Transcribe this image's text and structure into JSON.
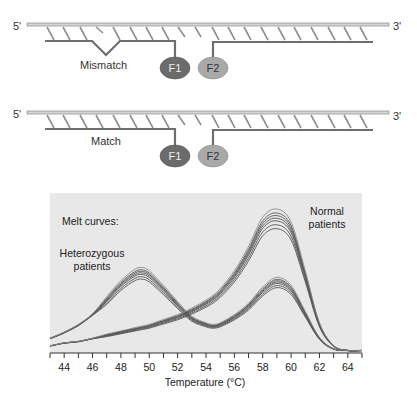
{
  "panels": {
    "mismatch": {
      "five_prime": "5'",
      "three_prime": "3'",
      "label": "Mismatch",
      "probe1": "F1",
      "probe2": "F2"
    },
    "match": {
      "five_prime": "5'",
      "three_prime": "3'",
      "label": "Match",
      "probe1": "F1",
      "probe2": "F2"
    }
  },
  "colors": {
    "strand": "#c8c8c8",
    "strand_outline": "#9a9a9a",
    "hatch": "#8f8f8f",
    "probe_line": "#6e6e6e",
    "f1_fill": "#6b6b6b",
    "f2_fill": "#a9a9a9",
    "chart_bg": "#e8e8e8",
    "curve": "#555555"
  },
  "chart_data": {
    "type": "line",
    "title": "",
    "annotations": [
      "Melt curves:",
      "Heterozygous patients",
      "Normal patients"
    ],
    "xlabel": "Temperature (°C)",
    "ylabel": "",
    "xlim": [
      43,
      65
    ],
    "x_ticks": [
      44,
      46,
      48,
      50,
      52,
      54,
      56,
      58,
      60,
      62,
      64
    ],
    "grid": false,
    "legend": "none (inline annotations)",
    "x": [
      43,
      44,
      45,
      46,
      47,
      48,
      49,
      49.5,
      50,
      51,
      52,
      53,
      54,
      54.5,
      55,
      56,
      57,
      58,
      59,
      60,
      61,
      62,
      63,
      64,
      65
    ],
    "series": [
      {
        "name": "Heterozygous patients",
        "values": [
          0.09,
          0.13,
          0.18,
          0.25,
          0.34,
          0.44,
          0.51,
          0.52,
          0.5,
          0.41,
          0.31,
          0.22,
          0.18,
          0.17,
          0.18,
          0.23,
          0.3,
          0.4,
          0.46,
          0.41,
          0.25,
          0.09,
          0.02,
          0.01,
          0.01
        ]
      },
      {
        "name": "Normal patients",
        "values": [
          0.04,
          0.06,
          0.07,
          0.09,
          0.11,
          0.13,
          0.15,
          0.16,
          0.17,
          0.2,
          0.23,
          0.27,
          0.32,
          0.35,
          0.39,
          0.5,
          0.65,
          0.83,
          0.88,
          0.8,
          0.5,
          0.18,
          0.04,
          0.01,
          0.01
        ]
      }
    ]
  }
}
